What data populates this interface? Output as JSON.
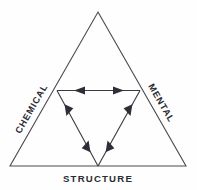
{
  "diagram": {
    "type": "triad-triangle",
    "title": "",
    "background_color": "#fefefe",
    "line_color": "#4a4a52",
    "arrow_color": "#2e2e36",
    "text_color": "#2b2b33",
    "vertices": {
      "apex": {
        "x": 98,
        "y": 12
      },
      "bottom_left": {
        "x": 10,
        "y": 166
      },
      "bottom_right": {
        "x": 186,
        "y": 166
      }
    },
    "labels": {
      "left": "CHEMICAL",
      "right": "MENTAL",
      "bottom": "STRUCTURE"
    },
    "relations": [
      {
        "name": "chemical-mental",
        "from": "CHEMICAL",
        "to": "MENTAL",
        "bidirectional": true,
        "orientation": "horizontal"
      },
      {
        "name": "chemical-structure",
        "from": "CHEMICAL",
        "to": "STRUCTURE",
        "bidirectional": true,
        "orientation": "diagonal-left"
      },
      {
        "name": "mental-structure",
        "from": "MENTAL",
        "to": "STRUCTURE",
        "bidirectional": true,
        "orientation": "diagonal-right"
      }
    ]
  }
}
